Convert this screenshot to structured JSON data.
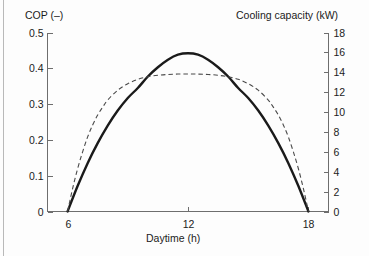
{
  "chart_data": {
    "type": "line",
    "title": "",
    "xlabel": "Daytime (h)",
    "ylabel": "COP (–)",
    "ylabel_right": "Cooling capacity (kW)",
    "xlim": [
      5,
      19
    ],
    "ylim": [
      0,
      0.5
    ],
    "ylim_right": [
      0,
      18
    ],
    "grid": false,
    "legend": "none",
    "xticks": [
      6,
      12,
      18
    ],
    "xtick_labels": [
      "6",
      "12",
      "18"
    ],
    "yticks_left": [
      0,
      0.1,
      0.2,
      0.3,
      0.4,
      0.5
    ],
    "ytick_labels_left": [
      "0",
      "0.1",
      "0.2",
      "0.3",
      "0.4",
      "0.5"
    ],
    "yticks_right": [
      0,
      2,
      4,
      6,
      8,
      10,
      12,
      14,
      16,
      18
    ],
    "ytick_labels_right": [
      "0",
      "2",
      "4",
      "6",
      "8",
      "10",
      "12",
      "14",
      "16",
      "18"
    ],
    "series": [
      {
        "name": "COP",
        "axis": "left",
        "style": "solid",
        "color": "#1a1a1a",
        "x": [
          6.0,
          6.5,
          7.0,
          7.5,
          8.0,
          8.5,
          9.0,
          9.5,
          10.0,
          10.5,
          11.0,
          11.5,
          12.0,
          12.5,
          13.0,
          13.5,
          14.0,
          14.5,
          15.0,
          15.5,
          16.0,
          16.5,
          17.0,
          17.5,
          18.0
        ],
        "y": [
          0.0,
          0.071,
          0.135,
          0.191,
          0.24,
          0.282,
          0.317,
          0.345,
          0.377,
          0.403,
          0.424,
          0.438,
          0.442,
          0.438,
          0.424,
          0.403,
          0.377,
          0.345,
          0.317,
          0.282,
          0.24,
          0.191,
          0.135,
          0.071,
          0.0
        ]
      },
      {
        "name": "Cooling capacity",
        "axis": "right",
        "style": "dashed",
        "color": "#4a4a4a",
        "x": [
          6.0,
          6.25,
          6.5,
          6.75,
          7.0,
          7.25,
          7.5,
          7.75,
          8.0,
          8.5,
          9.0,
          9.5,
          10.0,
          10.5,
          11.0,
          11.5,
          12.0,
          12.5,
          13.0,
          13.5,
          14.0,
          14.5,
          15.0,
          15.5,
          16.0,
          16.25,
          16.5,
          16.75,
          17.0,
          17.25,
          17.5,
          17.75,
          18.0
        ],
        "y": [
          0.0,
          2.3,
          4.3,
          6.0,
          7.5,
          8.7,
          9.7,
          10.5,
          11.2,
          12.2,
          12.85,
          13.3,
          13.55,
          13.7,
          13.78,
          13.82,
          13.83,
          13.82,
          13.78,
          13.7,
          13.55,
          13.3,
          12.85,
          12.2,
          11.2,
          10.5,
          9.7,
          8.7,
          7.5,
          6.0,
          4.3,
          2.3,
          0.0
        ]
      }
    ]
  },
  "axes": {
    "frame_color": "#6e6e6e",
    "tick_color": "#6e6e6e",
    "text_color": "#1b1b1b"
  }
}
